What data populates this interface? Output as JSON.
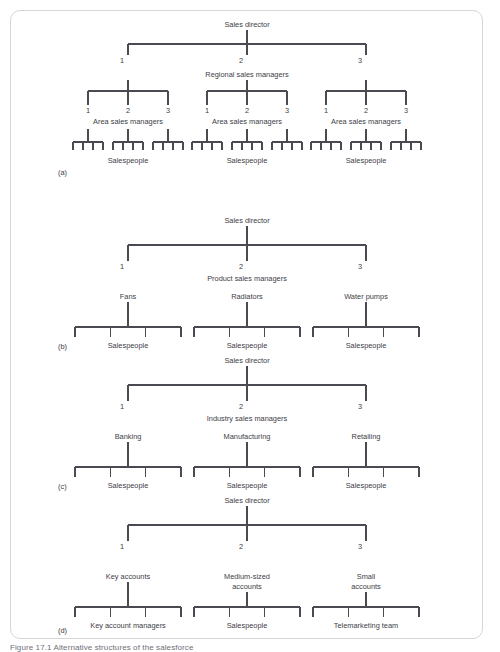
{
  "figure": {
    "caption": "Figure 17.1 Alternative structures of the salesforce",
    "root_label": "Sales director",
    "branch_numbers": [
      "1",
      "2",
      "3"
    ],
    "salespeople_label": "Salespeople",
    "line_color": "#4a4a52",
    "text_color": "#3d3d46",
    "frame_border_color": "#d6d6d6",
    "background_color": "#ffffff"
  },
  "panels": [
    {
      "key": "a",
      "tag": "(a)",
      "root": "Sales director",
      "level1_numbers": [
        "1",
        "2",
        "3"
      ],
      "level1_label": "Regional sales managers",
      "groups": [
        {
          "numbers": [
            "1",
            "2",
            "3"
          ],
          "label": "Area sales managers",
          "leaf_label": "Salespeople",
          "leaf_ticks": [
            4,
            4,
            4
          ]
        },
        {
          "numbers": [
            "1",
            "2",
            "3"
          ],
          "label": "Area sales managers",
          "leaf_label": "Salespeople",
          "leaf_ticks": [
            4,
            4,
            4
          ]
        },
        {
          "numbers": [
            "1",
            "2",
            "3"
          ],
          "label": "Area sales managers",
          "leaf_label": "Salespeople",
          "leaf_ticks": [
            4,
            4,
            4
          ]
        }
      ]
    },
    {
      "key": "b",
      "tag": "(b)",
      "root": "Sales director",
      "level1_numbers": [
        "1",
        "2",
        "3"
      ],
      "level1_label": "Product sales managers",
      "branches": [
        {
          "title": "Fans",
          "leaf_label": "Salespeople",
          "leaf_ticks": 4
        },
        {
          "title": "Radiators",
          "leaf_label": "Salespeople",
          "leaf_ticks": 4
        },
        {
          "title": "Water pumps",
          "leaf_label": "Salespeople",
          "leaf_ticks": 4
        }
      ]
    },
    {
      "key": "c",
      "tag": "(c)",
      "root": "Sales director",
      "level1_numbers": [
        "1",
        "2",
        "3"
      ],
      "level1_label": "Industry sales managers",
      "branches": [
        {
          "title": "Banking",
          "leaf_label": "Salespeople",
          "leaf_ticks": 4
        },
        {
          "title": "Manufacturing",
          "leaf_label": "Salespeople",
          "leaf_ticks": 4
        },
        {
          "title": "Retailing",
          "leaf_label": "Salespeople",
          "leaf_ticks": 4
        }
      ]
    },
    {
      "key": "d",
      "tag": "(d)",
      "root": "Sales director",
      "level1_numbers": [
        "1",
        "2",
        "3"
      ],
      "level1_label": "",
      "branches": [
        {
          "title": "Key accounts",
          "title2": "",
          "leaf_label": "Key account managers",
          "leaf_ticks": 4
        },
        {
          "title": "Medium-sized",
          "title2": "accounts",
          "leaf_label": "Salespeople",
          "leaf_ticks": 4
        },
        {
          "title": "Small",
          "title2": "accounts",
          "leaf_label": "Telemarketing team",
          "leaf_ticks": 4
        }
      ]
    }
  ]
}
